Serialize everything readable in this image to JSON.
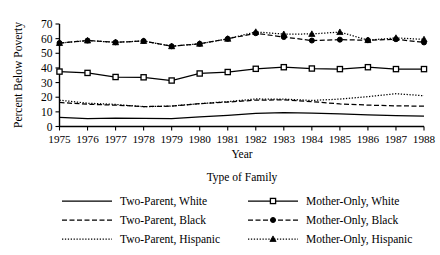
{
  "chart_data": {
    "type": "line",
    "title": "",
    "xlabel": "Year",
    "ylabel": "Percent Below Poverty",
    "legend_title": "Type of Family",
    "legend_position": "bottom",
    "grid": false,
    "x": [
      1975,
      1976,
      1977,
      1978,
      1979,
      1980,
      1981,
      1982,
      1983,
      1984,
      1985,
      1986,
      1987,
      1988
    ],
    "xtick_labels": [
      "1975",
      "1976",
      "1977",
      "1978",
      "1979",
      "1980",
      "1981",
      "1982",
      "1983",
      "1984",
      "1985",
      "1986",
      "1987",
      "1988"
    ],
    "ytick_labels": [
      "0",
      "10",
      "20",
      "30",
      "40",
      "50",
      "60",
      "70"
    ],
    "yticks": [
      0,
      10,
      20,
      30,
      40,
      50,
      60,
      70
    ],
    "ylim": [
      0,
      70
    ],
    "xlim": [
      1975,
      1988
    ],
    "series": [
      {
        "name": "Two-Parent, White",
        "line_style": "solid",
        "marker": "none",
        "color": "#000000",
        "values": [
          6.2,
          5.4,
          5.8,
          5.5,
          5.4,
          6.5,
          7.6,
          8.9,
          9.4,
          9.2,
          8.6,
          8.0,
          7.4,
          7.1
        ]
      },
      {
        "name": "Two-Parent, Black",
        "line_style": "dashed",
        "marker": "none",
        "color": "#000000",
        "values": [
          16.4,
          15.2,
          14.6,
          13.6,
          13.9,
          15.6,
          16.7,
          18.0,
          18.2,
          17.0,
          15.4,
          14.6,
          14.1,
          13.9
        ]
      },
      {
        "name": "Two-Parent, Hispanic",
        "line_style": "dotted",
        "marker": "none",
        "color": "#000000",
        "values": [
          18.0,
          15.9,
          15.1,
          13.5,
          14.0,
          15.6,
          17.0,
          18.8,
          18.7,
          17.8,
          18.7,
          20.4,
          22.4,
          21.0
        ]
      },
      {
        "name": "Mother-Only, White",
        "line_style": "solid",
        "marker": "square",
        "color": "#000000",
        "values": [
          37.5,
          36.6,
          33.8,
          33.6,
          31.4,
          36.2,
          37.2,
          39.4,
          40.5,
          39.6,
          39.2,
          40.5,
          39.2,
          39.2
        ]
      },
      {
        "name": "Mother-Only, Black",
        "line_style": "dashed",
        "marker": "circle",
        "color": "#000000",
        "values": [
          57.0,
          58.7,
          57.5,
          58.4,
          54.8,
          56.5,
          59.9,
          63.7,
          61.1,
          58.7,
          59.3,
          58.9,
          59.6,
          57.4
        ]
      },
      {
        "name": "Mother-Only, Hispanic",
        "line_style": "dotted",
        "marker": "triangle",
        "color": "#000000",
        "values": [
          57.0,
          58.7,
          57.5,
          58.4,
          54.8,
          56.5,
          59.9,
          64.6,
          63.1,
          63.2,
          64.5,
          59.0,
          60.5,
          59.5
        ]
      }
    ],
    "legend_entries": [
      {
        "label": "Two-Parent, White",
        "line_style": "solid",
        "marker": "none"
      },
      {
        "label": "Mother-Only, White",
        "line_style": "solid",
        "marker": "square"
      },
      {
        "label": "Two-Parent, Black",
        "line_style": "dashed",
        "marker": "none"
      },
      {
        "label": "Mother-Only, Black",
        "line_style": "dashed",
        "marker": "circle"
      },
      {
        "label": "Two-Parent, Hispanic",
        "line_style": "dotted",
        "marker": "none"
      },
      {
        "label": "Mother-Only, Hispanic",
        "line_style": "dotted",
        "marker": "triangle"
      }
    ]
  }
}
